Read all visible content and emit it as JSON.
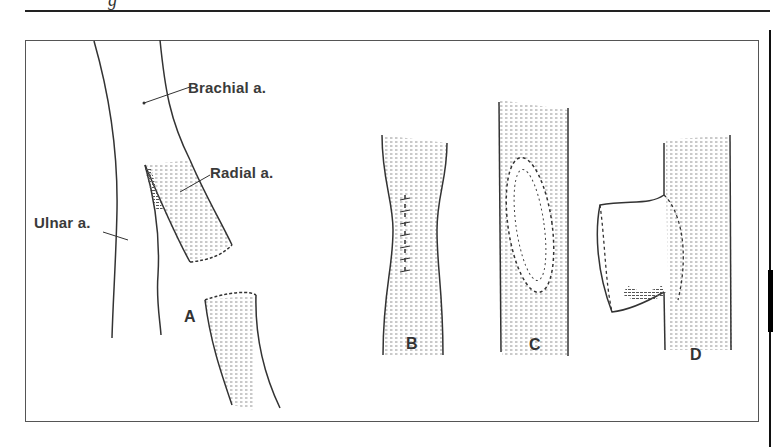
{
  "page": {
    "header_fragment": "g"
  },
  "figure": {
    "labels": {
      "brachial": "Brachial a.",
      "radial": "Radial a.",
      "ulnar": "Ulnar a."
    },
    "panels": [
      {
        "id": "A",
        "label": "A"
      },
      {
        "id": "B",
        "label": "B"
      },
      {
        "id": "C",
        "label": "C"
      },
      {
        "id": "D",
        "label": "D"
      }
    ]
  },
  "colors": {
    "ink": "#333333",
    "frame": "#555555",
    "background": "#ffffff"
  }
}
